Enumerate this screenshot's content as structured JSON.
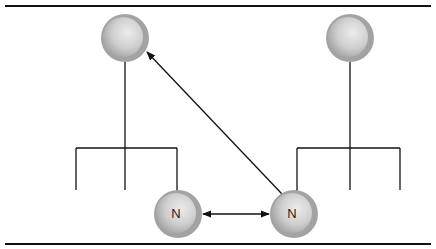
{
  "figure": {
    "border_color": "#111111",
    "line_color": "#111111",
    "node_fill_light": "#e6e6e6",
    "node_fill_dark": "#a8a8a8",
    "node_ring": "#9a9a9a",
    "nodes": [
      {
        "id": "top-left",
        "label": "",
        "cx": 125,
        "cy": 38,
        "r": 24
      },
      {
        "id": "top-right",
        "label": "",
        "cx": 350,
        "cy": 38,
        "r": 24
      },
      {
        "id": "bottom-left",
        "label": "N",
        "cx": 178,
        "cy": 214,
        "r": 24
      },
      {
        "id": "bottom-right",
        "label": "N",
        "cx": 294,
        "cy": 214,
        "r": 24
      }
    ],
    "edges": [
      {
        "from": "bottom-right",
        "to": "top-left",
        "type": "directed"
      },
      {
        "from": "bottom-left",
        "to": "bottom-right",
        "type": "bidirectional"
      }
    ],
    "trees": [
      {
        "root": "top-left",
        "children_count": 3,
        "child_node": "bottom-left"
      },
      {
        "root": "top-right",
        "children_count": 3,
        "child_node": "bottom-right"
      }
    ]
  }
}
